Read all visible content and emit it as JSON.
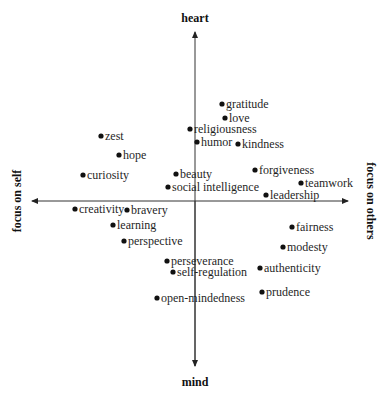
{
  "chart_data": {
    "type": "scatter",
    "title": "",
    "axes": {
      "top_label": "heart",
      "bottom_label": "mind",
      "left_label": "focus on self",
      "right_label": "focus on others",
      "xlim": [
        -1,
        1
      ],
      "ylim": [
        -1,
        1
      ],
      "grid": false
    },
    "points": [
      {
        "label": "gratitude",
        "x": 0.17,
        "y": 0.57,
        "px": 222,
        "py": 104
      },
      {
        "label": "love",
        "x": 0.19,
        "y": 0.49,
        "px": 225,
        "py": 118
      },
      {
        "label": "religiousness",
        "x": -0.03,
        "y": 0.43,
        "px": 190,
        "py": 129
      },
      {
        "label": "humor",
        "x": 0.01,
        "y": 0.35,
        "px": 197,
        "py": 142
      },
      {
        "label": "kindness",
        "x": 0.27,
        "y": 0.34,
        "px": 238,
        "py": 144
      },
      {
        "label": "zest",
        "x": -0.59,
        "y": 0.38,
        "px": 101,
        "py": 136
      },
      {
        "label": "hope",
        "x": -0.48,
        "y": 0.27,
        "px": 119,
        "py": 155
      },
      {
        "label": "curiosity",
        "x": -0.7,
        "y": 0.15,
        "px": 83,
        "py": 175
      },
      {
        "label": "beauty",
        "x": -0.12,
        "y": 0.16,
        "px": 176,
        "py": 174
      },
      {
        "label": "forgiveness",
        "x": 0.38,
        "y": 0.18,
        "px": 255,
        "py": 170
      },
      {
        "label": "teamwork",
        "x": 0.66,
        "y": 0.11,
        "px": 301,
        "py": 183
      },
      {
        "label": "social intelligence",
        "x": -0.17,
        "y": 0.08,
        "px": 168,
        "py": 187
      },
      {
        "label": "leadership",
        "x": 0.44,
        "y": 0.04,
        "px": 266,
        "py": 195
      },
      {
        "label": "creativity",
        "x": -0.75,
        "y": -0.05,
        "px": 75,
        "py": 209
      },
      {
        "label": "bravery",
        "x": -0.42,
        "y": -0.05,
        "px": 127,
        "py": 210
      },
      {
        "label": "learning",
        "x": -0.51,
        "y": -0.14,
        "px": 113,
        "py": 225
      },
      {
        "label": "perspective",
        "x": -0.44,
        "y": -0.24,
        "px": 124,
        "py": 241
      },
      {
        "label": "fairness",
        "x": 0.61,
        "y": -0.15,
        "px": 292,
        "py": 227
      },
      {
        "label": "modesty",
        "x": 0.55,
        "y": -0.27,
        "px": 283,
        "py": 247
      },
      {
        "label": "authenticity",
        "x": 0.41,
        "y": -0.4,
        "px": 260,
        "py": 268
      },
      {
        "label": "prudence",
        "x": 0.42,
        "y": -0.54,
        "px": 262,
        "py": 292
      },
      {
        "label": "perseverance",
        "x": -0.17,
        "y": -0.36,
        "px": 167,
        "py": 261
      },
      {
        "label": "self-regulation",
        "x": -0.14,
        "y": -0.42,
        "px": 173,
        "py": 272
      },
      {
        "label": "open-mindedness",
        "x": -0.23,
        "y": -0.58,
        "px": 157,
        "py": 298
      }
    ]
  }
}
